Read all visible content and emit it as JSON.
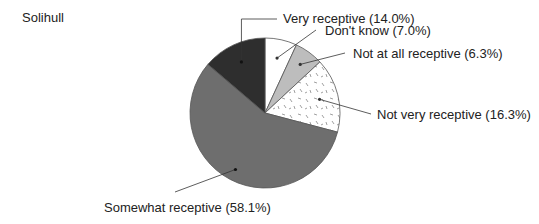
{
  "chart_data": {
    "type": "pie",
    "title": "Solihull",
    "start_angle_deg": 0,
    "direction": "clockwise",
    "slices": [
      {
        "name": "Don't know",
        "value": 7.0,
        "label": "Don't know (7.0%)",
        "fill": "#ffffff",
        "pattern": "none"
      },
      {
        "name": "Not at all receptive",
        "value": 6.3,
        "label": "Not at all receptive (6.3%)",
        "fill": "#bdbdbd",
        "pattern": "none"
      },
      {
        "name": "Not very receptive",
        "value": 16.3,
        "label": "Not very receptive (16.3%)",
        "fill": "#ffffff",
        "pattern": "dashes"
      },
      {
        "name": "Somewhat receptive",
        "value": 58.1,
        "label": "Somewhat receptive (58.1%)",
        "fill": "#6e6e6e",
        "pattern": "none"
      },
      {
        "name": "Very receptive",
        "value": 14.0,
        "label": "Very receptive (14.0%)",
        "fill": "#2e2e2e",
        "pattern": "none"
      }
    ],
    "legend": "none (leader-line labels)",
    "units": "%"
  }
}
